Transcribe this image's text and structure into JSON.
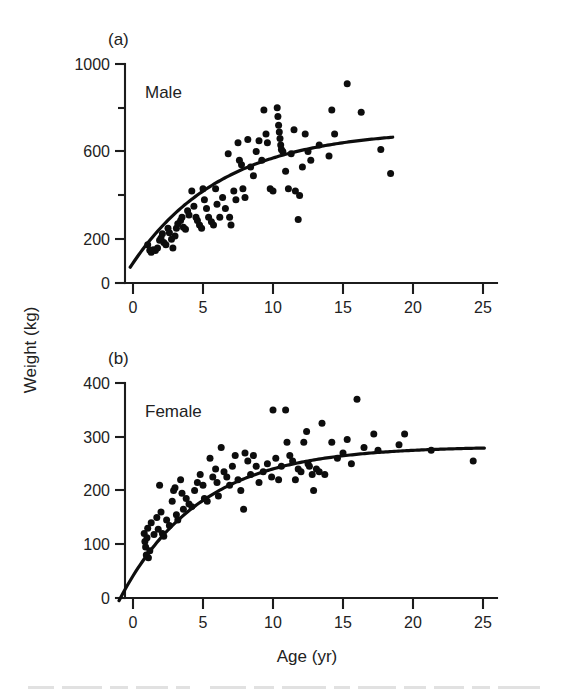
{
  "figure": {
    "background": "#ffffff",
    "ink_color": "#0d0d0d",
    "xlabel": "Age (yr)",
    "ylabel": "Weight (kg)"
  },
  "panel_a": {
    "label": "(a)",
    "series_label": "Male"
  },
  "panel_b": {
    "label": "(b)",
    "series_label": "Female"
  },
  "chart_data": [
    {
      "type": "scatter",
      "panel": "(a)",
      "title": "Male",
      "xlabel": "Age (yr)",
      "ylabel": "Weight (kg)",
      "xlim": [
        -1.2,
        26
      ],
      "ylim": [
        0,
        1000
      ],
      "xticks": [
        0,
        5,
        10,
        15,
        20,
        25
      ],
      "xticklabels": [
        "0",
        "5",
        "10",
        "15",
        "20",
        "25"
      ],
      "yticks": [
        0,
        200,
        400,
        600,
        800,
        1000
      ],
      "yticklabels": [
        "0",
        "200",
        "",
        "600",
        "",
        "1000"
      ],
      "ytick_minor": [
        400,
        800
      ],
      "grid": false,
      "legend": "none",
      "points": [
        [
          1.05,
          175
        ],
        [
          1.2,
          150
        ],
        [
          1.3,
          140
        ],
        [
          1.45,
          152
        ],
        [
          1.6,
          148
        ],
        [
          1.75,
          160
        ],
        [
          1.9,
          195
        ],
        [
          2.0,
          205
        ],
        [
          2.1,
          225
        ],
        [
          2.2,
          185
        ],
        [
          2.35,
          175
        ],
        [
          2.5,
          250
        ],
        [
          2.6,
          230
        ],
        [
          2.75,
          200
        ],
        [
          2.85,
          160
        ],
        [
          3.0,
          215
        ],
        [
          3.1,
          250
        ],
        [
          3.2,
          270
        ],
        [
          3.4,
          285
        ],
        [
          3.5,
          300
        ],
        [
          3.6,
          255
        ],
        [
          3.75,
          245
        ],
        [
          3.9,
          330
        ],
        [
          4.0,
          310
        ],
        [
          4.2,
          420
        ],
        [
          4.35,
          350
        ],
        [
          4.5,
          300
        ],
        [
          4.6,
          285
        ],
        [
          4.75,
          265
        ],
        [
          4.9,
          250
        ],
        [
          5.0,
          430
        ],
        [
          5.1,
          380
        ],
        [
          5.25,
          340
        ],
        [
          5.4,
          300
        ],
        [
          5.6,
          280
        ],
        [
          5.75,
          265
        ],
        [
          5.9,
          430
        ],
        [
          6.0,
          360
        ],
        [
          6.2,
          300
        ],
        [
          6.4,
          390
        ],
        [
          6.6,
          340
        ],
        [
          6.8,
          590
        ],
        [
          6.9,
          300
        ],
        [
          7.0,
          265
        ],
        [
          7.2,
          420
        ],
        [
          7.35,
          380
        ],
        [
          7.5,
          640
        ],
        [
          7.6,
          560
        ],
        [
          7.75,
          540
        ],
        [
          7.85,
          430
        ],
        [
          8.0,
          390
        ],
        [
          8.2,
          655
        ],
        [
          8.4,
          530
        ],
        [
          8.6,
          490
        ],
        [
          8.8,
          600
        ],
        [
          9.0,
          650
        ],
        [
          9.2,
          560
        ],
        [
          9.35,
          790
        ],
        [
          9.5,
          680
        ],
        [
          9.6,
          640
        ],
        [
          9.8,
          430
        ],
        [
          10.0,
          420
        ],
        [
          10.3,
          800
        ],
        [
          10.35,
          760
        ],
        [
          10.4,
          720
        ],
        [
          10.45,
          690
        ],
        [
          10.5,
          660
        ],
        [
          10.55,
          630
        ],
        [
          10.6,
          610
        ],
        [
          10.7,
          600
        ],
        [
          10.9,
          510
        ],
        [
          11.1,
          430
        ],
        [
          11.3,
          590
        ],
        [
          11.5,
          700
        ],
        [
          11.6,
          420
        ],
        [
          11.8,
          290
        ],
        [
          11.9,
          400
        ],
        [
          12.1,
          530
        ],
        [
          12.3,
          680
        ],
        [
          12.5,
          600
        ],
        [
          12.7,
          560
        ],
        [
          13.3,
          630
        ],
        [
          14.0,
          580
        ],
        [
          14.2,
          790
        ],
        [
          14.4,
          680
        ],
        [
          15.3,
          910
        ],
        [
          16.3,
          780
        ],
        [
          17.7,
          610
        ],
        [
          18.4,
          500
        ]
      ],
      "fit_curve": {
        "model": "von Bertalanffy growth",
        "asymptote": 700,
        "x_start": -0.2,
        "x_end": 18.6,
        "description": "rises steeply from ~80 kg near birth, plateaus near 700 kg by age 18"
      }
    },
    {
      "type": "scatter",
      "panel": "(b)",
      "title": "Female",
      "xlabel": "Age (yr)",
      "ylabel": "Weight (kg)",
      "xlim": [
        -1.2,
        26
      ],
      "ylim": [
        0,
        400
      ],
      "xticks": [
        0,
        5,
        10,
        15,
        20,
        25
      ],
      "xticklabels": [
        "0",
        "5",
        "10",
        "15",
        "20",
        "25"
      ],
      "yticks": [
        0,
        100,
        200,
        300,
        400
      ],
      "yticklabels": [
        "0",
        "100",
        "200",
        "300",
        "400"
      ],
      "ytick_minor": [],
      "grid": false,
      "legend": "none",
      "points": [
        [
          0.8,
          120
        ],
        [
          0.85,
          105
        ],
        [
          0.9,
          95
        ],
        [
          0.95,
          80
        ],
        [
          1.0,
          112
        ],
        [
          1.05,
          130
        ],
        [
          1.1,
          75
        ],
        [
          1.2,
          88
        ],
        [
          1.3,
          140
        ],
        [
          1.5,
          118
        ],
        [
          1.7,
          150
        ],
        [
          1.8,
          128
        ],
        [
          1.9,
          210
        ],
        [
          2.0,
          160
        ],
        [
          2.1,
          120
        ],
        [
          2.2,
          115
        ],
        [
          2.4,
          145
        ],
        [
          2.6,
          135
        ],
        [
          2.8,
          180
        ],
        [
          2.9,
          200
        ],
        [
          3.0,
          205
        ],
        [
          3.1,
          155
        ],
        [
          3.2,
          145
        ],
        [
          3.4,
          220
        ],
        [
          3.5,
          195
        ],
        [
          3.6,
          165
        ],
        [
          3.8,
          185
        ],
        [
          4.0,
          175
        ],
        [
          4.2,
          170
        ],
        [
          4.4,
          200
        ],
        [
          4.6,
          215
        ],
        [
          4.8,
          230
        ],
        [
          5.0,
          210
        ],
        [
          5.1,
          185
        ],
        [
          5.3,
          180
        ],
        [
          5.5,
          260
        ],
        [
          5.7,
          225
        ],
        [
          5.9,
          240
        ],
        [
          6.0,
          215
        ],
        [
          6.1,
          190
        ],
        [
          6.3,
          280
        ],
        [
          6.5,
          235
        ],
        [
          6.7,
          225
        ],
        [
          6.9,
          210
        ],
        [
          7.1,
          245
        ],
        [
          7.3,
          265
        ],
        [
          7.5,
          220
        ],
        [
          7.7,
          200
        ],
        [
          7.9,
          165
        ],
        [
          8.0,
          270
        ],
        [
          8.2,
          255
        ],
        [
          8.4,
          230
        ],
        [
          8.6,
          265
        ],
        [
          8.8,
          245
        ],
        [
          9.0,
          215
        ],
        [
          9.3,
          235
        ],
        [
          9.6,
          250
        ],
        [
          9.9,
          225
        ],
        [
          10.0,
          350
        ],
        [
          10.2,
          260
        ],
        [
          10.4,
          220
        ],
        [
          10.6,
          245
        ],
        [
          10.9,
          350
        ],
        [
          11.0,
          290
        ],
        [
          11.2,
          265
        ],
        [
          11.4,
          255
        ],
        [
          11.6,
          220
        ],
        [
          11.8,
          240
        ],
        [
          12.0,
          235
        ],
        [
          12.2,
          290
        ],
        [
          12.4,
          310
        ],
        [
          12.5,
          250
        ],
        [
          12.6,
          245
        ],
        [
          12.8,
          230
        ],
        [
          12.9,
          200
        ],
        [
          13.1,
          240
        ],
        [
          13.3,
          235
        ],
        [
          13.5,
          325
        ],
        [
          13.7,
          230
        ],
        [
          14.2,
          290
        ],
        [
          14.6,
          260
        ],
        [
          15.0,
          270
        ],
        [
          15.3,
          295
        ],
        [
          15.6,
          250
        ],
        [
          16.0,
          370
        ],
        [
          16.5,
          280
        ],
        [
          17.2,
          305
        ],
        [
          17.5,
          275
        ],
        [
          19.0,
          285
        ],
        [
          19.4,
          305
        ],
        [
          21.3,
          275
        ],
        [
          24.3,
          255
        ]
      ],
      "fit_curve": {
        "model": "von Bertalanffy growth",
        "asymptote": 282,
        "x_start": -1.0,
        "x_end": 25.2,
        "description": "rises from ~45 kg, plateaus near 282 kg by age 17"
      }
    }
  ]
}
